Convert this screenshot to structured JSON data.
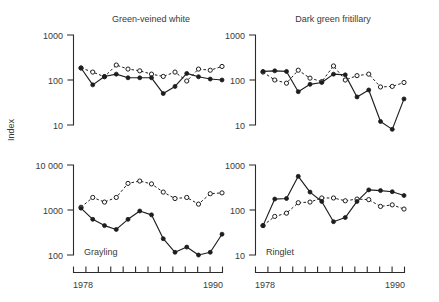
{
  "figure": {
    "axis_title_y": "Index",
    "x_axis": {
      "start_label": "1978",
      "end_label": "1990",
      "start": 1978,
      "end": 1990,
      "ticks": [
        1978,
        1979,
        1980,
        1981,
        1982,
        1983,
        1984,
        1985,
        1986,
        1987,
        1988,
        1989,
        1990
      ]
    }
  },
  "chart_data": [
    {
      "type": "line",
      "title": "Green-veined white",
      "position": "top-left",
      "xlabel": "",
      "ylabel": "Index",
      "x": [
        1978,
        1979,
        1980,
        1981,
        1982,
        1983,
        1984,
        1985,
        1986,
        1987,
        1988,
        1989,
        1990
      ],
      "ylim": [
        10,
        1000
      ],
      "yscale": "log",
      "yticks": [
        10,
        100,
        1000
      ],
      "ytick_labels": [
        "10",
        "100",
        "1000"
      ],
      "grid": false,
      "legend": "none",
      "series": [
        {
          "name": "solid-filled-circles",
          "marker": "filled-circle",
          "line": "solid",
          "values": [
            185,
            78,
            120,
            135,
            112,
            112,
            112,
            50,
            72,
            140,
            118,
            105,
            100
          ]
        },
        {
          "name": "dashed-open-circles",
          "marker": "open-circle",
          "line": "dashed",
          "values": [
            185,
            150,
            118,
            215,
            175,
            160,
            135,
            120,
            150,
            95,
            175,
            165,
            200
          ]
        }
      ]
    },
    {
      "type": "line",
      "title": "Dark green fritillary",
      "position": "top-right",
      "xlabel": "",
      "ylabel": "",
      "x": [
        1978,
        1979,
        1980,
        1981,
        1982,
        1983,
        1984,
        1985,
        1986,
        1987,
        1988,
        1989,
        1990
      ],
      "ylim": [
        10,
        1000
      ],
      "yscale": "log",
      "yticks": [
        10,
        100,
        1000
      ],
      "ytick_labels": [
        "10",
        "100",
        "1000"
      ],
      "grid": false,
      "legend": "none",
      "series": [
        {
          "name": "solid-filled-circles",
          "marker": "filled-circle",
          "line": "solid",
          "values": [
            155,
            160,
            155,
            55,
            80,
            88,
            135,
            130,
            42,
            60,
            12,
            8,
            38
          ]
        },
        {
          "name": "dashed-open-circles",
          "marker": "open-circle",
          "line": "dashed",
          "values": [
            150,
            100,
            85,
            165,
            110,
            92,
            205,
            100,
            125,
            135,
            70,
            72,
            88
          ]
        }
      ]
    },
    {
      "type": "line",
      "title": "Grayling",
      "position": "bottom-left",
      "xlabel": "",
      "ylabel": "Index",
      "x": [
        1978,
        1979,
        1980,
        1981,
        1982,
        1983,
        1984,
        1985,
        1986,
        1987,
        1988,
        1989,
        1990
      ],
      "ylim": [
        100,
        10000
      ],
      "yscale": "log",
      "yticks": [
        100,
        1000,
        10000
      ],
      "ytick_labels": [
        "100",
        "1000",
        "10 000"
      ],
      "grid": false,
      "legend": "none",
      "series": [
        {
          "name": "solid-filled-circles",
          "marker": "filled-circle",
          "line": "solid",
          "values": [
            1100,
            620,
            450,
            370,
            620,
            950,
            780,
            230,
            115,
            150,
            100,
            115,
            290
          ]
        },
        {
          "name": "dashed-open-circles",
          "marker": "open-circle",
          "line": "dashed",
          "values": [
            1150,
            1900,
            1500,
            1900,
            3900,
            4400,
            3800,
            2500,
            1800,
            1900,
            1350,
            2300,
            2400
          ]
        }
      ]
    },
    {
      "type": "line",
      "title": "Ringlet",
      "position": "bottom-right",
      "xlabel": "",
      "ylabel": "",
      "x": [
        1978,
        1979,
        1980,
        1981,
        1982,
        1983,
        1984,
        1985,
        1986,
        1987,
        1988,
        1989,
        1990
      ],
      "ylim": [
        10,
        1000
      ],
      "yscale": "log",
      "yticks": [
        10,
        100,
        1000
      ],
      "ytick_labels": [
        "10",
        "100",
        "1000"
      ],
      "grid": false,
      "legend": "none",
      "series": [
        {
          "name": "solid-filled-circles",
          "marker": "filled-circle",
          "line": "solid",
          "values": [
            45,
            175,
            180,
            560,
            250,
            155,
            55,
            68,
            155,
            280,
            270,
            255,
            210
          ]
        },
        {
          "name": "dashed-open-circles",
          "marker": "open-circle",
          "line": "dashed",
          "values": [
            45,
            72,
            85,
            145,
            150,
            185,
            185,
            160,
            175,
            170,
            120,
            130,
            105
          ]
        }
      ]
    }
  ]
}
